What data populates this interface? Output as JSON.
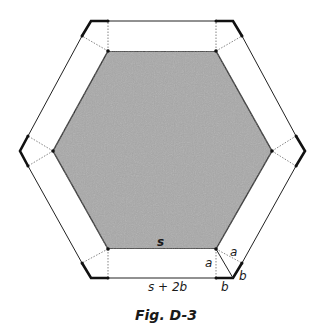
{
  "figure": {
    "caption": "Fig. D-3",
    "colors": {
      "inner_fill": "#a9a9a9",
      "stroke": "#222222",
      "dotted": "#777777",
      "background": "#ffffff"
    },
    "labels": {
      "inner_side": "s",
      "outer_side": "s + 2b",
      "vertical_a": "a",
      "diagonal_a": "a",
      "bottom_b": "b",
      "side_b": "b"
    }
  }
}
